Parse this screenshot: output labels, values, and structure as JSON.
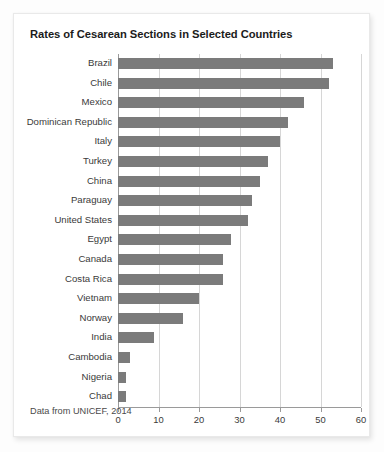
{
  "card": {
    "title": "Rates of Cesarean Sections in Selected Countries",
    "footnote": "Data from UNICEF, 2014",
    "bar_color": "#7b7b7b",
    "grid_color": "#d6d6d6",
    "axis_color": "#9a9a9a",
    "background": "#ffffff"
  },
  "chart_data": {
    "type": "bar",
    "orientation": "horizontal",
    "title": "Rates of Cesarean Sections in Selected Countries",
    "xlabel": "",
    "ylabel": "",
    "xlim": [
      0,
      60
    ],
    "xticks": [
      0,
      10,
      20,
      30,
      40,
      50,
      60
    ],
    "grid": true,
    "legend": "none",
    "annotations": [
      "Data from UNICEF, 2014"
    ],
    "categories": [
      "Brazil",
      "Chile",
      "Mexico",
      "Dominican Republic",
      "Italy",
      "Turkey",
      "China",
      "Paraguay",
      "United States",
      "Egypt",
      "Canada",
      "Costa Rica",
      "Vietnam",
      "Norway",
      "India",
      "Cambodia",
      "Nigeria",
      "Chad"
    ],
    "values": [
      53,
      52,
      46,
      42,
      40,
      37,
      35,
      33,
      32,
      28,
      26,
      26,
      20,
      16,
      9,
      3,
      2,
      2
    ]
  }
}
